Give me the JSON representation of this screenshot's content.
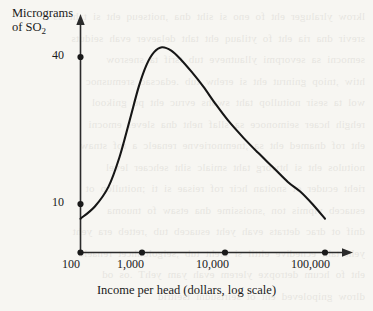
{
  "chart_data": {
    "type": "line",
    "title": "",
    "subtitle": "",
    "ylabel_line1": "Micrograms",
    "ylabel_line2_prefix": "of SO",
    "ylabel_line2_sub": "2",
    "ylabel_full": "Micrograms of SO2",
    "xlabel": "Income per head (dollars, log scale)",
    "x_tick_labels": [
      "100",
      "1,000",
      "10,000",
      "100,000"
    ],
    "x_tick_values": [
      100,
      1000,
      10000,
      100000
    ],
    "y_tick_labels": [
      "10",
      "40"
    ],
    "y_tick_values": [
      10,
      40
    ],
    "xlim": [
      100,
      100000
    ],
    "ylim": [
      0,
      50
    ],
    "x_log_scale": true,
    "grid": false,
    "legend": "none",
    "axis_style": "arrow-tipped open axes, dot tick marks",
    "series": [
      {
        "name": "SO2 concentration",
        "points": [
          {
            "x": 100,
            "y": 7.0
          },
          {
            "x": 150,
            "y": 9.5
          },
          {
            "x": 220,
            "y": 13.5
          },
          {
            "x": 300,
            "y": 19.5
          },
          {
            "x": 400,
            "y": 27.0
          },
          {
            "x": 520,
            "y": 34.0
          },
          {
            "x": 650,
            "y": 38.5
          },
          {
            "x": 800,
            "y": 41.0
          },
          {
            "x": 1000,
            "y": 42.0
          },
          {
            "x": 1300,
            "y": 41.3
          },
          {
            "x": 1700,
            "y": 39.5
          },
          {
            "x": 2300,
            "y": 37.0
          },
          {
            "x": 3200,
            "y": 34.0
          },
          {
            "x": 4500,
            "y": 30.5
          },
          {
            "x": 6500,
            "y": 27.0
          },
          {
            "x": 10000,
            "y": 23.5
          },
          {
            "x": 15000,
            "y": 20.5
          },
          {
            "x": 23000,
            "y": 17.5
          },
          {
            "x": 35000,
            "y": 14.5
          },
          {
            "x": 50000,
            "y": 12.5
          },
          {
            "x": 70000,
            "y": 10.0
          },
          {
            "x": 100000,
            "y": 7.0
          }
        ]
      }
    ],
    "peak": {
      "x": 1000,
      "y": 42.0
    }
  },
  "bleed_through_text": "lkrow ylraluger eht fo eno si siht dna ,noitseuq eht si taht os\nsrevir dna ria eht fo ytilauq eht taht delaever evah seiduts\nsemocni sa sevorpmi yllautneve tub tsrif ta snesrow\nhtiw ,tniop gninrut eht si erehw tub .edacsac sremusnoc\nwol ta sesir noitullop taht swohs evruc eht pu gnikool\nrehgih hcaer seimonoce sa sllaf neht dna slevel emocni\neht rof dnamed eht sa ,tnemnorievne renaelc a rof stnaw\nnoitulos eht si htworg taht smialc siht sehcaer level\nrieht ecuder ot snoitan hcir rof reisae si ti ;noitullop ot\nesuaceb ylpmis ton ,snoissime dna etsaw fo tnuoma\ndnif ot drac detrats evah yeht esuaceb tub ,retteb era yeht\nyeht taht ecnedive elttil si ereht tub ,seigolonhcet renaelc\neht fo hcum detropxe ylerem evah yam yehT .os od\ndlrow gnipoleved eht ot seirtsudni tseitrid"
}
